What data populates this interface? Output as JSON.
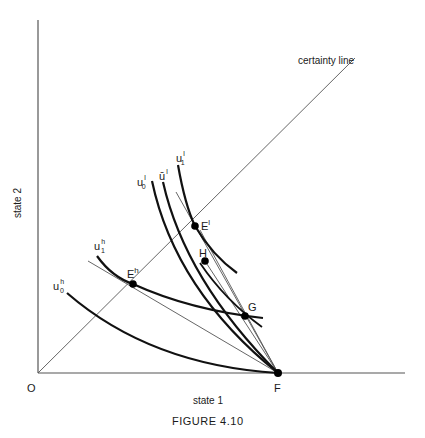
{
  "figure": {
    "caption": "FIGURE 4.10",
    "x_axis_label": "state 1",
    "y_axis_label": "state 2",
    "origin_label": "O",
    "certainty_line_label": "certainty line"
  },
  "points": {
    "F": {
      "label": "F"
    },
    "G": {
      "label": "G"
    },
    "H": {
      "label": "H"
    },
    "El": {
      "label": "E",
      "sup": "l"
    },
    "Eh": {
      "label": "E",
      "sup": "h"
    }
  },
  "curves": {
    "u0h": {
      "label": "u",
      "sup": "h",
      "sub": "0"
    },
    "u1h": {
      "label": "u",
      "sup": "h",
      "sub": "1"
    },
    "u0l": {
      "label": "u",
      "sup": "l",
      "sub": "0"
    },
    "ubarl": {
      "label": "ū",
      "sup": "l"
    },
    "u1l": {
      "label": "u",
      "sup": "l",
      "sub": "1"
    }
  },
  "colors": {
    "background": "#ffffff",
    "thick_curve": "#111111",
    "thin_line": "#555555"
  }
}
